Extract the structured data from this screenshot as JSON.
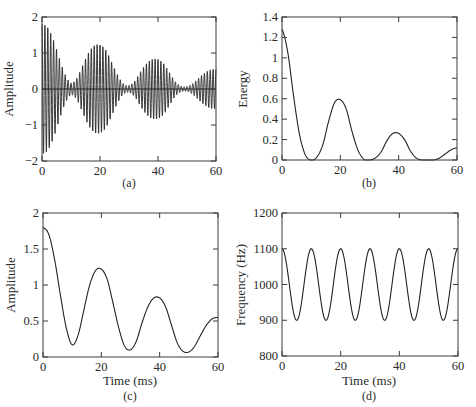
{
  "chart_data": [
    {
      "id": "a",
      "type": "line",
      "caption": "(a)",
      "title": "",
      "xlabel": "",
      "ylabel": "Amplitude",
      "xlim": [
        0,
        60
      ],
      "ylim": [
        -2,
        2
      ],
      "xticks": [
        0,
        20,
        40,
        60
      ],
      "yticks": [
        -2,
        -1,
        0,
        1,
        2
      ],
      "xtick_labels": [
        "0",
        "20",
        "40",
        "60"
      ],
      "ytick_labels": [
        "−2",
        "−1",
        "0",
        "1",
        "2"
      ],
      "grid": false,
      "zero_line": true,
      "description": "AM-modulated oscillation: carrier ~1 kHz (period ~1 ms) with envelope equal to panel (c)",
      "envelope_peaks": {
        "x": [
          0,
          20,
          40,
          60
        ],
        "y": [
          1.8,
          1.22,
          0.82,
          0.55
        ]
      },
      "envelope_minima": {
        "x": [
          10,
          30,
          50
        ],
        "y": [
          0.17,
          0.1,
          0.07
        ]
      },
      "carrier_period_ms": 1.0
    },
    {
      "id": "b",
      "type": "line",
      "caption": "(b)",
      "title": "",
      "xlabel": "",
      "ylabel": "Energy",
      "xlim": [
        0,
        60
      ],
      "ylim": [
        0,
        1.4
      ],
      "xticks": [
        0,
        20,
        40,
        60
      ],
      "yticks": [
        0,
        0.2,
        0.4,
        0.6,
        0.8,
        1,
        1.2,
        1.4
      ],
      "xtick_labels": [
        "0",
        "20",
        "40",
        "60"
      ],
      "ytick_labels": [
        "0",
        "0.2",
        "0.4",
        "0.6",
        "0.8",
        "1",
        "1.2",
        "1.4"
      ],
      "grid": false,
      "x": [
        0,
        2,
        4,
        6,
        8,
        10,
        12,
        14,
        16,
        18,
        20,
        22,
        24,
        26,
        28,
        30,
        32,
        34,
        36,
        38,
        40,
        42,
        44,
        46,
        48,
        50,
        52,
        54,
        56,
        58,
        60
      ],
      "y": [
        1.28,
        1.05,
        0.62,
        0.25,
        0.05,
        0.0,
        0.03,
        0.15,
        0.38,
        0.56,
        0.59,
        0.5,
        0.28,
        0.1,
        0.01,
        0.0,
        0.02,
        0.08,
        0.19,
        0.26,
        0.26,
        0.2,
        0.09,
        0.02,
        0.0,
        0.0,
        0.0,
        0.02,
        0.06,
        0.1,
        0.12
      ]
    },
    {
      "id": "c",
      "type": "line",
      "caption": "(c)",
      "title": "",
      "xlabel": "Time (ms)",
      "ylabel": "Amplitude",
      "xlim": [
        0,
        60
      ],
      "ylim": [
        0,
        2
      ],
      "xticks": [
        0,
        20,
        40,
        60
      ],
      "yticks": [
        0,
        0.5,
        1,
        1.5,
        2
      ],
      "xtick_labels": [
        "0",
        "20",
        "40",
        "60"
      ],
      "ytick_labels": [
        "0",
        "0.5",
        "1",
        "1.5",
        "2"
      ],
      "grid": false,
      "x": [
        0,
        2,
        4,
        6,
        8,
        10,
        12,
        14,
        16,
        18,
        20,
        22,
        24,
        26,
        28,
        30,
        32,
        34,
        36,
        38,
        40,
        42,
        44,
        46,
        48,
        50,
        52,
        54,
        56,
        58,
        60
      ],
      "y": [
        1.8,
        1.7,
        1.35,
        0.85,
        0.4,
        0.17,
        0.3,
        0.65,
        1.0,
        1.2,
        1.22,
        1.08,
        0.75,
        0.4,
        0.15,
        0.1,
        0.22,
        0.48,
        0.7,
        0.82,
        0.82,
        0.7,
        0.45,
        0.2,
        0.08,
        0.07,
        0.15,
        0.3,
        0.44,
        0.53,
        0.55
      ]
    },
    {
      "id": "d",
      "type": "line",
      "caption": "(d)",
      "title": "",
      "xlabel": "Time (ms)",
      "ylabel": "Frequency (Hz)",
      "xlim": [
        0,
        60
      ],
      "ylim": [
        800,
        1200
      ],
      "xticks": [
        0,
        20,
        40,
        60
      ],
      "yticks": [
        800,
        900,
        1000,
        1100,
        1200
      ],
      "xtick_labels": [
        "0",
        "20",
        "40",
        "60"
      ],
      "ytick_labels": [
        "800",
        "900",
        "1000",
        "1100",
        "1200"
      ],
      "grid": false,
      "description": "Sinusoidal frequency modulation 1000 ± 100 Hz, period 10 ms",
      "x": [
        0,
        5,
        10,
        15,
        20,
        25,
        30,
        35,
        40,
        45,
        50,
        55,
        60
      ],
      "y": [
        1100,
        900,
        1095,
        900,
        1100,
        900,
        1095,
        900,
        1100,
        900,
        1095,
        900,
        1100
      ]
    }
  ],
  "panels": {
    "a": {
      "caption": "(a)",
      "ylabel": "Amplitude"
    },
    "b": {
      "caption": "(b)",
      "ylabel": "Energy"
    },
    "c": {
      "caption": "(c)",
      "ylabel": "Amplitude",
      "xlabel": "Time (ms)"
    },
    "d": {
      "caption": "(d)",
      "ylabel": "Frequency (Hz)",
      "xlabel": "Time (ms)"
    }
  },
  "colors": {
    "line": "#222222",
    "axes": "#3a3a3a",
    "background": "#ffffff"
  }
}
